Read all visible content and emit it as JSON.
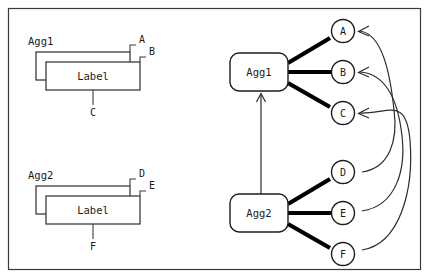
{
  "diagram": {
    "title_hidden": "",
    "left_panel": {
      "groups": [
        {
          "name": "Agg1",
          "label": "Label",
          "corner_labels": [
            "A",
            "B"
          ],
          "bottom_label": "C"
        },
        {
          "name": "Agg2",
          "label": "Label",
          "corner_labels": [
            "D",
            "E"
          ],
          "bottom_label": "F"
        }
      ]
    },
    "right_panel": {
      "nodes": [
        {
          "id": "agg1",
          "label": "Agg1",
          "shape": "rounded-rect"
        },
        {
          "id": "agg2",
          "label": "Agg2",
          "shape": "rounded-rect"
        }
      ],
      "circles": [
        {
          "id": "A",
          "label": "A"
        },
        {
          "id": "B",
          "label": "B"
        },
        {
          "id": "C",
          "label": "C"
        },
        {
          "id": "D",
          "label": "D"
        },
        {
          "id": "E",
          "label": "E"
        },
        {
          "id": "F",
          "label": "F"
        }
      ],
      "edges": [
        {
          "from": "agg1",
          "to": "A",
          "style": "thick"
        },
        {
          "from": "agg1",
          "to": "B",
          "style": "thick"
        },
        {
          "from": "agg1",
          "to": "C",
          "style": "thick"
        },
        {
          "from": "agg2",
          "to": "D",
          "style": "thick"
        },
        {
          "from": "agg2",
          "to": "E",
          "style": "thick"
        },
        {
          "from": "agg2",
          "to": "F",
          "style": "thick"
        },
        {
          "from": "agg2",
          "to": "agg1",
          "style": "thin-arrow"
        },
        {
          "from": "D",
          "to": "A",
          "style": "curved-arrow"
        },
        {
          "from": "E",
          "to": "B",
          "style": "curved-arrow"
        },
        {
          "from": "F",
          "to": "C",
          "style": "curved-arrow"
        }
      ]
    },
    "colors": {
      "stroke": "#1d1d1d",
      "frame": "#3a3a3a",
      "background": "#ffffff"
    }
  }
}
